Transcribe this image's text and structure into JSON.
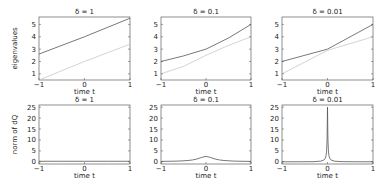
{
  "chart_data": [
    {
      "type": "line",
      "title": "δ = 1",
      "xlabel": "time t",
      "ylabel": "eigenvalues",
      "xlim": [
        -1,
        1
      ],
      "ylim": [
        0.5,
        5.6
      ],
      "xticks": [
        -1,
        0,
        1
      ],
      "yticks": [
        1,
        2,
        3,
        4,
        5
      ],
      "grid": false,
      "series": [
        {
          "name": "eigenvalue 1",
          "color": "#555555",
          "x": [
            -1,
            0,
            1
          ],
          "y": [
            2.6,
            4.0,
            5.5
          ]
        },
        {
          "name": "eigenvalue 2",
          "color": "#c8c8c8",
          "x": [
            -1,
            0,
            1
          ],
          "y": [
            0.5,
            2.0,
            3.4
          ]
        }
      ]
    },
    {
      "type": "line",
      "title": "δ = 0.1",
      "xlabel": "time t",
      "ylabel": "",
      "xlim": [
        -1,
        1
      ],
      "ylim": [
        0.5,
        5.6
      ],
      "xticks": [
        -1,
        0,
        1
      ],
      "yticks": [
        1,
        2,
        3,
        4,
        5
      ],
      "grid": false,
      "series": [
        {
          "name": "eigenvalue 1",
          "color": "#555555",
          "x": [
            -1,
            -0.5,
            0,
            0.5,
            1
          ],
          "y": [
            2.0,
            2.45,
            3.0,
            3.9,
            5.0
          ]
        },
        {
          "name": "eigenvalue 2",
          "color": "#c8c8c8",
          "x": [
            -1,
            -0.5,
            0,
            0.5,
            1
          ],
          "y": [
            1.0,
            1.6,
            2.5,
            3.3,
            4.0
          ]
        }
      ]
    },
    {
      "type": "line",
      "title": "δ = 0.01",
      "xlabel": "time t",
      "ylabel": "",
      "xlim": [
        -1,
        1
      ],
      "ylim": [
        0.5,
        5.6
      ],
      "xticks": [
        -1,
        0,
        1
      ],
      "yticks": [
        1,
        2,
        3,
        4,
        5
      ],
      "grid": false,
      "series": [
        {
          "name": "eigenvalue 1",
          "color": "#555555",
          "x": [
            -1,
            0,
            1
          ],
          "y": [
            2.0,
            3.0,
            5.0
          ]
        },
        {
          "name": "eigenvalue 2",
          "color": "#c8c8c8",
          "x": [
            -1,
            0,
            1
          ],
          "y": [
            1.0,
            2.9,
            4.0
          ]
        }
      ]
    },
    {
      "type": "line",
      "title": "δ = 1",
      "xlabel": "time t",
      "ylabel": "norm of dQ",
      "xlim": [
        -1,
        1
      ],
      "ylim": [
        -1,
        26
      ],
      "xticks": [
        -1,
        0,
        1
      ],
      "yticks": [
        0,
        5,
        10,
        15,
        20,
        25
      ],
      "grid": false,
      "series": [
        {
          "name": "norm of dQ",
          "color": "#555555",
          "x": [
            -1,
            -0.5,
            0,
            0.5,
            1
          ],
          "y": [
            0.25,
            0.25,
            0.25,
            0.25,
            0.25
          ]
        }
      ]
    },
    {
      "type": "line",
      "title": "δ = 0.1",
      "xlabel": "time t",
      "ylabel": "",
      "xlim": [
        -1,
        1
      ],
      "ylim": [
        -1,
        26
      ],
      "xticks": [
        -1,
        0,
        1
      ],
      "yticks": [
        0,
        5,
        10,
        15,
        20,
        25
      ],
      "grid": false,
      "series": [
        {
          "name": "norm of dQ",
          "color": "#555555",
          "x": [
            -1,
            -0.8,
            -0.6,
            -0.4,
            -0.3,
            -0.2,
            -0.1,
            0,
            0.1,
            0.2,
            0.3,
            0.4,
            0.6,
            0.8,
            1
          ],
          "y": [
            0.2,
            0.25,
            0.35,
            0.6,
            0.85,
            1.3,
            2.0,
            2.5,
            2.0,
            1.3,
            0.85,
            0.6,
            0.35,
            0.25,
            0.2
          ]
        }
      ]
    },
    {
      "type": "line",
      "title": "δ = 0.01",
      "xlabel": "time t",
      "ylabel": "",
      "xlim": [
        -1,
        1
      ],
      "ylim": [
        -1,
        26
      ],
      "xticks": [
        -1,
        0,
        1
      ],
      "yticks": [
        0,
        5,
        10,
        15,
        20,
        25
      ],
      "grid": false,
      "series": [
        {
          "name": "norm of dQ",
          "color": "#555555",
          "x": [
            -1,
            -0.6,
            -0.3,
            -0.15,
            -0.08,
            -0.05,
            -0.03,
            -0.02,
            -0.01,
            -0.005,
            0,
            0.005,
            0.01,
            0.02,
            0.03,
            0.05,
            0.08,
            0.15,
            0.3,
            0.6,
            1
          ],
          "y": [
            0.02,
            0.03,
            0.08,
            0.3,
            0.8,
            1.6,
            3.0,
            5.0,
            10.0,
            17.0,
            25.0,
            17.0,
            10.0,
            5.0,
            3.0,
            1.6,
            0.8,
            0.3,
            0.08,
            0.03,
            0.02
          ]
        }
      ]
    }
  ],
  "panels_layout": [
    {
      "left": 39,
      "top": 17,
      "width": 91,
      "height": 63
    },
    {
      "left": 161,
      "top": 17,
      "width": 90,
      "height": 63
    },
    {
      "left": 282,
      "top": 17,
      "width": 91,
      "height": 63
    },
    {
      "left": 39,
      "top": 105,
      "width": 91,
      "height": 59
    },
    {
      "left": 161,
      "top": 105,
      "width": 90,
      "height": 59
    },
    {
      "left": 282,
      "top": 105,
      "width": 91,
      "height": 59
    }
  ]
}
